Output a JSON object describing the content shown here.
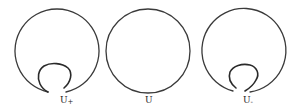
{
  "figure": {
    "panels": [
      {
        "id": "u-plus",
        "label": "U",
        "subscript": "+",
        "has_loop": true,
        "cx": 55,
        "cy": 51,
        "r": 42
      },
      {
        "id": "u",
        "label": "U",
        "subscript": "",
        "has_loop": false,
        "cx": 148,
        "cy": 51,
        "r": 42
      },
      {
        "id": "u-minus",
        "label": "U",
        "subscript": "-",
        "has_loop": true,
        "cx": 241,
        "cy": 51,
        "r": 42
      }
    ],
    "stroke_color": "#3a3a3a",
    "background": "#ffffff"
  }
}
